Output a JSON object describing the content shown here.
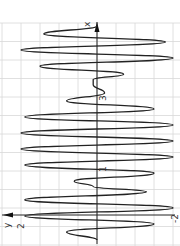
{
  "chart_data": {
    "type": "line",
    "title": "",
    "xlabel": "x",
    "ylabel": "y",
    "orientation": "rotated 90° (x-axis vertical, pointing up; y-axis horizontal, pointing left)",
    "x_tick_labels": [
      "1",
      "3"
    ],
    "y_tick_labels": [
      "2",
      "-2"
    ],
    "xlim": [
      0,
      4
    ],
    "ylim": [
      -2,
      2
    ],
    "grid": true,
    "series": [
      {
        "name": "y(x)",
        "description": "oscillating curve with varying amplitude; near-zero amplitude around x≈1 and x≈3",
        "x": [
          0,
          0.15,
          0.3,
          0.45,
          0.6,
          0.75,
          0.9,
          1.0,
          1.1,
          1.25,
          1.4,
          1.55,
          1.7,
          1.85,
          2.0,
          2.15,
          2.3,
          2.45,
          2.6,
          2.75,
          2.9,
          3.0,
          3.1,
          3.25,
          3.4,
          3.55,
          3.7,
          3.85,
          4.0
        ],
        "y": [
          0,
          0.8,
          -1.5,
          1.9,
          -2.0,
          1.9,
          -1.3,
          0.1,
          0.6,
          -1.5,
          1.9,
          -2.0,
          2.0,
          -2.0,
          2.0,
          -2.0,
          1.9,
          -1.5,
          0.8,
          -0.2,
          0.1,
          0.1,
          -0.7,
          1.5,
          -2.0,
          2.0,
          -1.8,
          1.4,
          0
        ]
      }
    ]
  },
  "labels": {
    "x_axis": "x",
    "y_axis": "y",
    "y_pos": "2",
    "y_neg": "-2",
    "x_tick_1": "1",
    "x_tick_3": "3"
  }
}
